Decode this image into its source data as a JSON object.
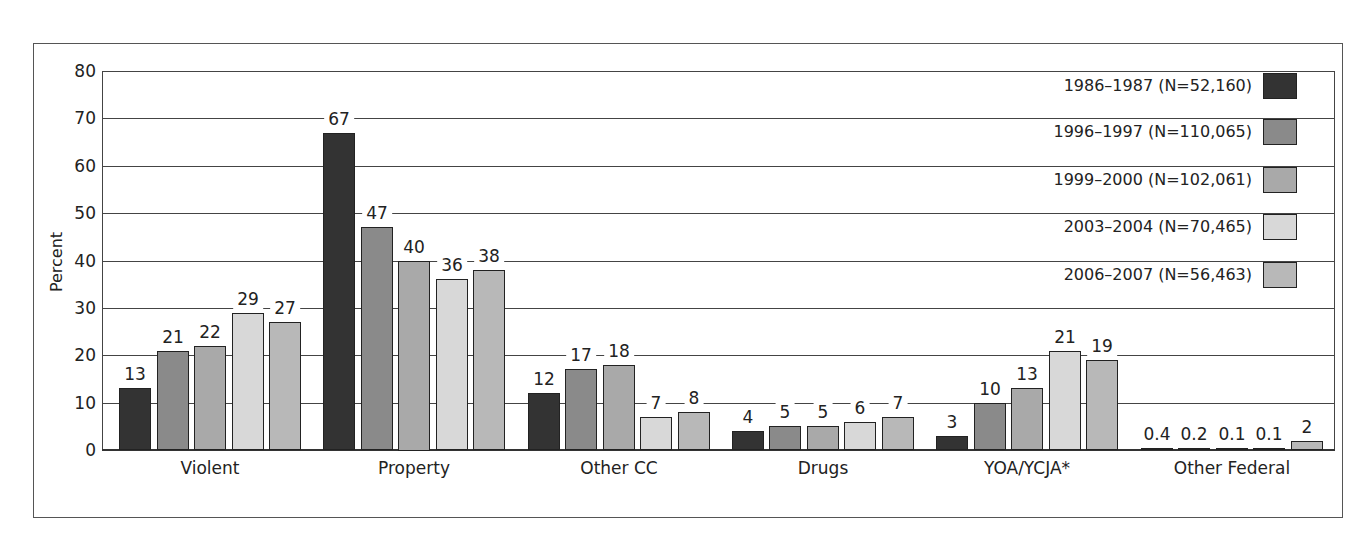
{
  "chart_data": {
    "type": "bar",
    "title": "",
    "xlabel": "",
    "ylabel": "Percent",
    "ylim": [
      0,
      80
    ],
    "yticks": [
      0,
      10,
      20,
      30,
      40,
      50,
      60,
      70,
      80
    ],
    "grid": true,
    "legend_position": "top-right",
    "categories": [
      "Violent",
      "Property",
      "Other CC",
      "Drugs",
      "YOA/YCJA*",
      "Other Federal"
    ],
    "series": [
      {
        "name": "1986–1987 (N=52,160)",
        "color": "#333333",
        "values": [
          13,
          67,
          12,
          4,
          3,
          0.4
        ],
        "labels": [
          "13",
          "67",
          "12",
          "4",
          "3",
          "0.4"
        ]
      },
      {
        "name": "1996–1997 (N=110,065)",
        "color": "#8a8a8a",
        "values": [
          21,
          47,
          17,
          5,
          10,
          0.2
        ],
        "labels": [
          "21",
          "47",
          "17",
          "5",
          "10",
          "0.2"
        ]
      },
      {
        "name": "1999–2000 (N=102,061)",
        "color": "#a9a9a9",
        "values": [
          22,
          40,
          18,
          5,
          13,
          0.1
        ],
        "labels": [
          "22",
          "40",
          "18",
          "5",
          "13",
          "0.1"
        ]
      },
      {
        "name": "2003–2004 (N=70,465)",
        "color": "#d8d8d8",
        "values": [
          29,
          36,
          7,
          6,
          21,
          0.1
        ],
        "labels": [
          "29",
          "36",
          "7",
          "6",
          "21",
          "0.1"
        ]
      },
      {
        "name": "2006–2007 (N=56,463)",
        "color": "#b8b8b8",
        "values": [
          27,
          38,
          8,
          7,
          19,
          2
        ],
        "labels": [
          "27",
          "38",
          "8",
          "7",
          "19",
          "2"
        ]
      }
    ]
  }
}
